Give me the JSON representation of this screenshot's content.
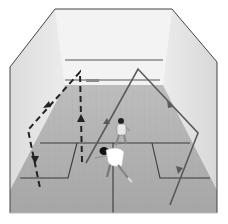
{
  "figure": {
    "caption_cropped": "",
    "colors": {
      "background": "#ffffff",
      "front_wall": "#f2f2f2",
      "side_wall_left": "#e6e6e6",
      "side_wall_right": "#e4e4e4",
      "floor": "#b5b5b5",
      "floor_near": "#a8a8a8",
      "court_lines": "#3a3a3a",
      "wall_outline": "#444444",
      "solid_path": "#5a5a5a",
      "dashed_path": "#2a2a2a",
      "player_shirt": "#ffffff",
      "player_hair": "#111111"
    },
    "paths": {
      "solid": {
        "label": "solid-trajectory",
        "points": [
          [
            86,
            163
          ],
          [
            138,
            69
          ],
          [
            198,
            133
          ],
          [
            170,
            205
          ]
        ],
        "arrows": [
          [
            107,
            122,
            "up-right"
          ],
          [
            170,
            104,
            "down-right"
          ],
          [
            180,
            170,
            "down-left"
          ]
        ]
      },
      "dashed": {
        "label": "dashed-trajectory",
        "points": [
          [
            82,
            162
          ],
          [
            80,
            72
          ],
          [
            28,
            130
          ],
          [
            40,
            188
          ]
        ],
        "arrows": [
          [
            81,
            119,
            "up"
          ],
          [
            47,
            104,
            "down-left"
          ],
          [
            34,
            160,
            "down"
          ]
        ]
      }
    },
    "players": [
      {
        "label": "far-player",
        "x": 121,
        "y": 128
      },
      {
        "label": "near-player",
        "x": 110,
        "y": 165
      }
    ]
  }
}
